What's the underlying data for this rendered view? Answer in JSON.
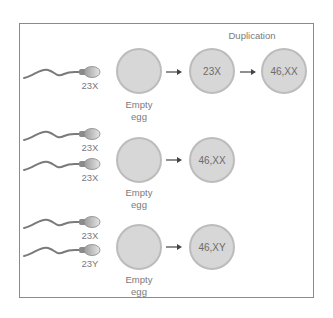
{
  "diagram": {
    "rows": [
      {
        "sperm": [
          {
            "label": "23X"
          }
        ],
        "egg_label": [
          "Empty",
          "egg"
        ],
        "steps": [
          "23X",
          "46,XX"
        ],
        "annotation": "Duplication"
      },
      {
        "sperm": [
          {
            "label": "23X"
          },
          {
            "label": "23X"
          }
        ],
        "egg_label": [
          "Empty",
          "egg"
        ],
        "steps": [
          "46,XX"
        ]
      },
      {
        "sperm": [
          {
            "label": "23X"
          },
          {
            "label": "23Y"
          }
        ],
        "egg_label": [
          "Empty",
          "egg"
        ],
        "steps": [
          "46,XY"
        ]
      }
    ],
    "colors": {
      "circle_fill": "#d7d7d7",
      "circle_border": "#bcbcbc",
      "frame": "#8a8a8a",
      "text": "#777777"
    }
  }
}
